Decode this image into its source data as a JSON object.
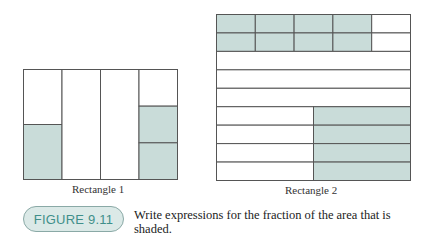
{
  "figure": {
    "number_label": "FIGURE 9.11",
    "prompt": "Write expressions for the fraction of the area that is shaded.",
    "colors": {
      "shade": "#c9dcd9",
      "line": "#555555",
      "badge_text": "#3f8f8a",
      "badge_fill": "#dbe9e7"
    }
  },
  "rectangle1": {
    "label": "Rectangle 1",
    "columns": 4,
    "column_parts": [
      {
        "divisions": 2,
        "shaded": [
          1
        ]
      },
      {
        "divisions": 1,
        "shaded": []
      },
      {
        "divisions": 1,
        "shaded": []
      },
      {
        "divisions": 3,
        "shaded": [
          1,
          2
        ]
      }
    ]
  },
  "rectangle2": {
    "label": "Rectangle 2",
    "rows": 9,
    "top_rows": {
      "count": 2,
      "columns": 5,
      "shaded_columns": 4
    },
    "middle_rows": {
      "count": 3,
      "shaded": false
    },
    "bottom_rows": {
      "count": 4,
      "halves": 2,
      "shaded_half": "right"
    }
  }
}
